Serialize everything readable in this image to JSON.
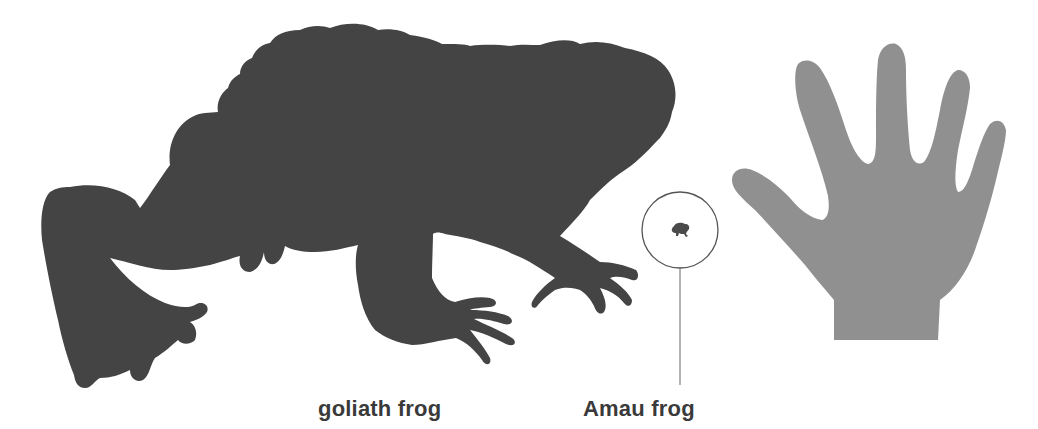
{
  "figure": {
    "colors": {
      "background": "#ffffff",
      "goliath_frog_fill": "#444444",
      "hand_fill": "#909090",
      "amau_frog_fill": "#4a4a4a",
      "callout_stroke": "#555555",
      "label_text": "#3a3a3a"
    }
  },
  "labels": {
    "goliath": "goliath frog",
    "amau": "Amau frog"
  },
  "icons": {
    "goliath": "goliath-frog-silhouette",
    "amau": "amau-frog-silhouette",
    "hand": "human-hand-silhouette",
    "callout": "magnifier-circle-callout"
  }
}
